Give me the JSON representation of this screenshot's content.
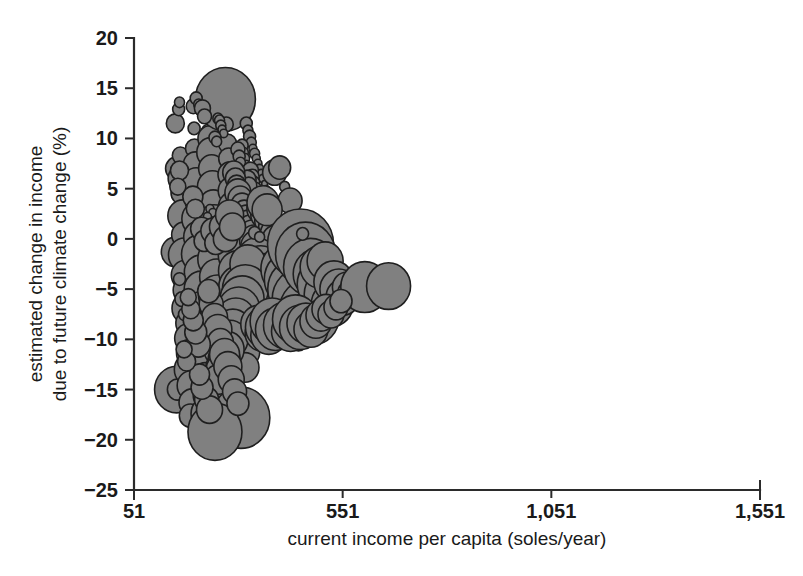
{
  "chart_data": {
    "type": "scatter",
    "title": "",
    "subtitle": "",
    "xlabel": "current income per capita (soles/year)",
    "ylabel_line1": "estimated change in income",
    "ylabel_line2": "due to future  climate change (%)",
    "xlim": [
      51,
      1551
    ],
    "ylim": [
      -25,
      20
    ],
    "xticks": [
      51,
      551,
      1051,
      1551
    ],
    "xtick_labels": [
      "51",
      "551",
      "1,051",
      "1,551"
    ],
    "yticks": [
      20,
      15,
      10,
      5,
      0,
      -5,
      -10,
      -15,
      -20,
      -25
    ],
    "ytick_labels": [
      "20",
      "15",
      "10",
      "5",
      "0",
      "-5",
      "-10",
      "-15",
      "-20",
      "-25"
    ],
    "grid": false,
    "legend": null,
    "marker": {
      "shape": "circle",
      "fill_color": "#808080",
      "edge_color": "#1f1f1f",
      "edge_width": 1.6,
      "size_meaning": "population / household weight"
    },
    "series": [
      {
        "name": "districts",
        "size_unit": "radius_px",
        "points": [
          [
            150,
            11.5,
            9
          ],
          [
            153,
            7.0,
            11
          ],
          [
            150,
            -1.3,
            14
          ],
          [
            153,
            -15.0,
            22
          ],
          [
            155,
            -15.0,
            10
          ],
          [
            158,
            12.9,
            6
          ],
          [
            160,
            13.6,
            5
          ],
          [
            162,
            8.3,
            8
          ],
          [
            164,
            6.0,
            13
          ],
          [
            166,
            4.6,
            11
          ],
          [
            168,
            2.3,
            15
          ],
          [
            170,
            0.4,
            12
          ],
          [
            172,
            -1.6,
            16
          ],
          [
            174,
            -3.6,
            14
          ],
          [
            176,
            -5.1,
            13
          ],
          [
            178,
            -6.9,
            15
          ],
          [
            180,
            -8.4,
            12
          ],
          [
            182,
            -9.9,
            14
          ],
          [
            184,
            -11.4,
            13
          ],
          [
            186,
            -13.0,
            16
          ],
          [
            188,
            -14.6,
            14
          ],
          [
            190,
            -16.3,
            13
          ],
          [
            186,
            -17.6,
            11
          ],
          [
            193,
            13.2,
            7
          ],
          [
            195,
            11.0,
            6
          ],
          [
            196,
            9.0,
            9
          ],
          [
            198,
            7.4,
            12
          ],
          [
            200,
            5.6,
            14
          ],
          [
            202,
            3.8,
            12
          ],
          [
            204,
            2.0,
            16
          ],
          [
            206,
            0.2,
            15
          ],
          [
            208,
            -1.5,
            18
          ],
          [
            210,
            -3.3,
            16
          ],
          [
            212,
            -5.0,
            17
          ],
          [
            214,
            -6.8,
            15
          ],
          [
            216,
            -8.5,
            16
          ],
          [
            218,
            -10.2,
            14
          ],
          [
            220,
            -12.0,
            15
          ],
          [
            222,
            -13.8,
            14
          ],
          [
            224,
            -15.6,
            13
          ],
          [
            226,
            -17.4,
            16
          ],
          [
            228,
            -19.0,
            19
          ],
          [
            231,
            10.6,
            8
          ],
          [
            233,
            10.0,
            12
          ],
          [
            235,
            8.6,
            14
          ],
          [
            237,
            7.0,
            13
          ],
          [
            239,
            5.2,
            15
          ],
          [
            241,
            3.4,
            14
          ],
          [
            243,
            1.6,
            17
          ],
          [
            245,
            -0.2,
            16
          ],
          [
            247,
            -2.0,
            18
          ],
          [
            249,
            -3.8,
            17
          ],
          [
            251,
            -5.6,
            19
          ],
          [
            253,
            -7.4,
            18
          ],
          [
            255,
            -9.2,
            17
          ],
          [
            257,
            -11.0,
            16
          ],
          [
            259,
            -12.8,
            15
          ],
          [
            261,
            -14.6,
            14
          ],
          [
            263,
            -16.4,
            13
          ],
          [
            265,
            -18.6,
            23
          ],
          [
            270,
            13.9,
            30
          ],
          [
            272,
            11.4,
            7
          ],
          [
            275,
            9.5,
            9
          ],
          [
            278,
            8.0,
            10
          ],
          [
            281,
            6.4,
            12
          ],
          [
            284,
            4.8,
            13
          ],
          [
            287,
            3.2,
            14
          ],
          [
            290,
            1.6,
            15
          ],
          [
            293,
            0.0,
            16
          ],
          [
            296,
            -1.6,
            18
          ],
          [
            299,
            -3.2,
            19
          ],
          [
            302,
            -4.8,
            20
          ],
          [
            305,
            -6.4,
            21
          ],
          [
            308,
            -8.0,
            20
          ],
          [
            311,
            -9.6,
            18
          ],
          [
            314,
            -11.2,
            16
          ],
          [
            317,
            -12.8,
            14
          ],
          [
            252,
            12.0,
            5
          ],
          [
            256,
            11.8,
            5
          ],
          [
            259,
            11.3,
            5
          ],
          [
            262,
            10.9,
            4
          ],
          [
            266,
            10.5,
            4
          ],
          [
            245,
            10.1,
            6
          ],
          [
            249,
            9.7,
            5
          ],
          [
            320,
            11.5,
            6
          ],
          [
            324,
            10.8,
            5
          ],
          [
            328,
            10.2,
            6
          ],
          [
            332,
            9.6,
            5
          ],
          [
            336,
            9.0,
            4
          ],
          [
            340,
            8.5,
            5
          ],
          [
            344,
            8.0,
            4
          ],
          [
            348,
            7.5,
            4
          ],
          [
            352,
            7.0,
            4
          ],
          [
            356,
            6.5,
            4
          ],
          [
            360,
            6.0,
            4
          ],
          [
            364,
            5.5,
            3
          ],
          [
            368,
            5.0,
            3
          ],
          [
            372,
            4.5,
            3
          ],
          [
            376,
            4.0,
            3
          ],
          [
            310,
            9.3,
            6
          ],
          [
            313,
            8.6,
            5
          ],
          [
            316,
            8.0,
            5
          ],
          [
            319,
            7.4,
            4
          ],
          [
            300,
            8.9,
            7
          ],
          [
            303,
            8.2,
            6
          ],
          [
            306,
            7.6,
            5
          ],
          [
            330,
            6.8,
            8
          ],
          [
            334,
            6.2,
            7
          ],
          [
            338,
            5.6,
            6
          ],
          [
            342,
            5.0,
            6
          ],
          [
            346,
            4.4,
            5
          ],
          [
            350,
            3.8,
            5
          ],
          [
            354,
            3.2,
            5
          ],
          [
            322,
            5.9,
            9
          ],
          [
            326,
            5.3,
            8
          ],
          [
            290,
            6.6,
            11
          ],
          [
            294,
            6.0,
            10
          ],
          [
            297,
            5.4,
            9
          ],
          [
            300,
            4.6,
            13
          ],
          [
            305,
            4.0,
            12
          ],
          [
            310,
            3.4,
            11
          ],
          [
            315,
            2.8,
            10
          ],
          [
            320,
            2.2,
            11
          ],
          [
            325,
            1.6,
            12
          ],
          [
            330,
            1.0,
            13
          ],
          [
            335,
            0.4,
            14
          ],
          [
            340,
            -0.2,
            15
          ],
          [
            345,
            -0.8,
            16
          ],
          [
            355,
            3.0,
            14
          ],
          [
            362,
            2.4,
            13
          ],
          [
            369,
            1.8,
            12
          ],
          [
            376,
            1.2,
            11
          ],
          [
            383,
            0.6,
            12
          ],
          [
            390,
            0.0,
            13
          ],
          [
            388,
            6.6,
            12
          ],
          [
            400,
            7.1,
            11
          ],
          [
            412,
            5.2,
            5
          ],
          [
            425,
            3.8,
            12
          ],
          [
            360,
            3.6,
            16
          ],
          [
            370,
            2.9,
            15
          ],
          [
            345,
            -2.0,
            20
          ],
          [
            355,
            -3.0,
            22
          ],
          [
            365,
            -4.0,
            24
          ],
          [
            375,
            -5.0,
            26
          ],
          [
            385,
            -6.0,
            27
          ],
          [
            395,
            -7.0,
            28
          ],
          [
            405,
            -8.0,
            26
          ],
          [
            340,
            -4.5,
            22
          ],
          [
            332,
            -3.5,
            20
          ],
          [
            324,
            -2.5,
            18
          ],
          [
            318,
            -5.0,
            23
          ],
          [
            310,
            -6.0,
            22
          ],
          [
            302,
            -7.0,
            21
          ],
          [
            295,
            -8.0,
            20
          ],
          [
            288,
            -9.0,
            19
          ],
          [
            281,
            -10.0,
            18
          ],
          [
            274,
            -11.0,
            17
          ],
          [
            267,
            -12.0,
            16
          ],
          [
            260,
            -13.0,
            15
          ],
          [
            253,
            -14.0,
            14
          ],
          [
            415,
            -3.0,
            25
          ],
          [
            428,
            -4.0,
            27
          ],
          [
            441,
            -5.0,
            29
          ],
          [
            454,
            -6.0,
            30
          ],
          [
            467,
            -7.0,
            28
          ],
          [
            480,
            -7.8,
            26
          ],
          [
            450,
            -0.5,
            33
          ],
          [
            462,
            -1.5,
            30
          ],
          [
            474,
            -2.8,
            27
          ],
          [
            455,
            0.5,
            6
          ],
          [
            490,
            -3.5,
            24
          ],
          [
            502,
            -4.5,
            25
          ],
          [
            514,
            -5.5,
            23
          ],
          [
            526,
            -6.5,
            21
          ],
          [
            497,
            -2.8,
            20
          ],
          [
            509,
            -2.2,
            18
          ],
          [
            530,
            -4.3,
            20
          ],
          [
            542,
            -5.0,
            19
          ],
          [
            552,
            -5.8,
            17
          ],
          [
            560,
            -4.8,
            14
          ],
          [
            568,
            -5.4,
            12
          ],
          [
            604,
            -4.8,
            24
          ],
          [
            661,
            -4.7,
            22
          ],
          [
            420,
            -10.1,
            8
          ],
          [
            445,
            -10.2,
            9
          ],
          [
            398,
            -10.3,
            7
          ],
          [
            307,
            -17.8,
            29
          ],
          [
            245,
            -19.2,
            27
          ],
          [
            340,
            0.6,
            6
          ],
          [
            352,
            0.2,
            5
          ],
          [
            233,
            3.0,
            4
          ],
          [
            240,
            2.6,
            4
          ],
          [
            227,
            2.2,
            4
          ],
          [
            200,
            14.0,
            6
          ],
          [
            206,
            13.4,
            5
          ],
          [
            215,
            13.0,
            8
          ],
          [
            220,
            12.2,
            7
          ],
          [
            166,
            -6.0,
            7
          ],
          [
            160,
            -4.0,
            6
          ],
          [
            172,
            -7.5,
            6
          ],
          [
            236,
            -6.5,
            12
          ],
          [
            230,
            -5.2,
            11
          ],
          [
            244,
            -7.8,
            13
          ],
          [
            252,
            -9.0,
            14
          ],
          [
            258,
            -10.3,
            13
          ],
          [
            268,
            -11.5,
            15
          ],
          [
            276,
            -12.7,
            14
          ],
          [
            284,
            -14.0,
            13
          ],
          [
            292,
            -15.2,
            12
          ],
          [
            300,
            -16.4,
            11
          ],
          [
            205,
            -10.5,
            12
          ],
          [
            199,
            -9.3,
            11
          ],
          [
            193,
            -8.1,
            10
          ],
          [
            187,
            -7.0,
            9
          ],
          [
            181,
            -5.8,
            8
          ],
          [
            225,
            -16.0,
            12
          ],
          [
            232,
            -17.0,
            13
          ],
          [
            214,
            -14.8,
            11
          ],
          [
            208,
            -13.5,
            10
          ],
          [
            177,
            -12.2,
            9
          ],
          [
            171,
            -11.0,
            8
          ],
          [
            350,
            -8.5,
            18
          ],
          [
            358,
            -9.4,
            17
          ],
          [
            366,
            -8.8,
            20
          ],
          [
            374,
            -9.6,
            18
          ],
          [
            382,
            -8.2,
            22
          ],
          [
            390,
            -9.0,
            20
          ],
          [
            414,
            -8.6,
            22
          ],
          [
            426,
            -9.2,
            19
          ],
          [
            438,
            -8.0,
            23
          ],
          [
            450,
            -8.8,
            21
          ],
          [
            463,
            -8.4,
            19
          ],
          [
            475,
            -9.0,
            17
          ],
          [
            487,
            -8.2,
            16
          ],
          [
            499,
            -7.6,
            15
          ],
          [
            511,
            -7.0,
            14
          ],
          [
            523,
            -7.5,
            13
          ],
          [
            535,
            -6.8,
            12
          ],
          [
            547,
            -6.2,
            11
          ],
          [
            160,
            6.8,
            9
          ],
          [
            156,
            5.2,
            8
          ],
          [
            192,
            4.2,
            10
          ],
          [
            198,
            3.0,
            9
          ],
          [
            213,
            1.0,
            11
          ],
          [
            219,
            -0.2,
            10
          ],
          [
            240,
            0.8,
            12
          ],
          [
            247,
            -0.4,
            11
          ],
          [
            263,
            1.2,
            13
          ],
          [
            270,
            0.0,
            12
          ],
          [
            280,
            2.4,
            14
          ],
          [
            287,
            1.2,
            13
          ]
        ]
      }
    ]
  },
  "axes": {
    "x_axis_name": "x-axis",
    "y_axis_name": "y-axis"
  }
}
